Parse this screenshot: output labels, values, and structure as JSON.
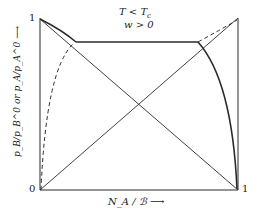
{
  "diagram": {
    "condition_line1": "T < T",
    "condition_sub": "c",
    "condition_line2": "w > 0",
    "y_axis_label": "p_B/p_B^0 or p_A/p_A^0",
    "x_axis_label": "N_A / ℬ",
    "tick_left_top": "1",
    "tick_origin": "0",
    "tick_right_bottom": "1",
    "tick_right_top": "1"
  }
}
